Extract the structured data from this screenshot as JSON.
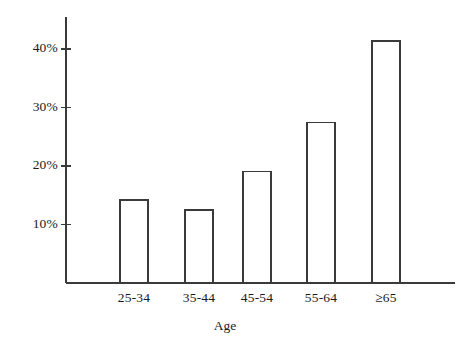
{
  "chart_data": {
    "type": "bar",
    "title": "",
    "subtitle": "",
    "xlabel": "Age",
    "ylabel": "",
    "categories": [
      "25-34",
      "35-44",
      "45-54",
      "55-64",
      "≥65"
    ],
    "values": [
      14.2,
      12.5,
      19.1,
      27.4,
      41.4
    ],
    "series": [
      {
        "name": "Percent",
        "values": [
          14.2,
          12.5,
          19.1,
          27.4,
          41.4
        ]
      }
    ],
    "ylim": [
      0,
      45
    ],
    "y_ticks": [
      10,
      20,
      30,
      40
    ],
    "y_tick_labels": [
      "10%",
      "20%",
      "30%",
      "40%"
    ],
    "grid": false,
    "legend": false,
    "legend_position": "none",
    "bar_fill_color": "#ffffff",
    "bar_edge_color": "#3a3a3a",
    "axis_color": "#3a3a3a",
    "background_color": "#ffffff"
  },
  "geometry": {
    "baseline_y": 283,
    "axis_x": 66,
    "axis_top_y": 17,
    "axis_right_x": 455,
    "px_per_percent": 5.85,
    "bar_width": 28,
    "bar_left_positions": [
      120,
      185,
      243,
      307,
      372
    ]
  }
}
